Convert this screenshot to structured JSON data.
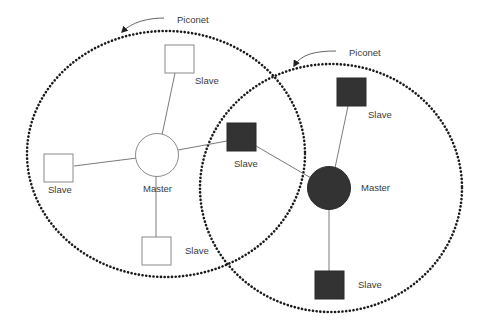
{
  "diagram": {
    "piconets": [
      {
        "label": "Piconet",
        "style": "hollow",
        "color": "#ffffff"
      },
      {
        "label": "Piconet",
        "style": "filled",
        "color": "#333333"
      }
    ],
    "nodes": {
      "left_master": {
        "label": "Master"
      },
      "left_slave_top": {
        "label": "Slave"
      },
      "left_slave_left": {
        "label": "Slave"
      },
      "left_slave_bottom": {
        "label": "Slave"
      },
      "bridge_slave": {
        "label": "Slave"
      },
      "right_master": {
        "label": "Master"
      },
      "right_slave_top": {
        "label": "Slave"
      },
      "right_slave_bottom": {
        "label": "Slave"
      }
    },
    "colors": {
      "boundary": "#1a1a1a",
      "filled_node": "#333333",
      "hollow_node_stroke": "#8a8a8a",
      "link": "#7a7a7a",
      "text": "#3a3a3a"
    }
  }
}
